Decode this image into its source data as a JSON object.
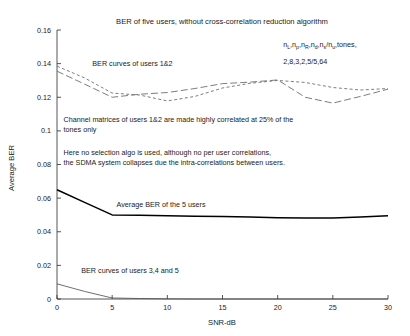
{
  "chart_data": {
    "type": "line",
    "title": "BER of five users, without cross-correlation reduction algorithm",
    "xlabel": "SNR-dB",
    "ylabel": "Average BER",
    "xlim": [
      0,
      30
    ],
    "ylim": [
      0,
      0.16
    ],
    "grid": false,
    "legend_position": "none",
    "xticks": [
      "0",
      "5",
      "10",
      "15",
      "20",
      "25",
      "30"
    ],
    "xtick_values": [
      0,
      5,
      10,
      15,
      20,
      25,
      30
    ],
    "yticks": [
      "0",
      "0.02",
      "0.04",
      "0.06",
      "0.08",
      "0.1",
      "0.12",
      "0.14",
      "0.16"
    ],
    "ytick_values": [
      0,
      0.02,
      0.04,
      0.06,
      0.08,
      0.1,
      0.12,
      0.14,
      0.16
    ],
    "x": [
      0,
      2.5,
      5,
      7.5,
      10,
      12.5,
      15,
      17.5,
      20,
      22.5,
      25,
      27.5,
      30
    ],
    "series": [
      {
        "name": "BER user 1",
        "style": "dashed",
        "values": [
          0.1385,
          0.1315,
          0.1225,
          0.1213,
          0.1178,
          0.1205,
          0.1255,
          0.1283,
          0.13,
          0.1288,
          0.1258,
          0.1243,
          0.1252
        ]
      },
      {
        "name": "BER user 2",
        "style": "dash-long",
        "values": [
          0.1355,
          0.1278,
          0.12,
          0.1218,
          0.1228,
          0.1252,
          0.1281,
          0.129,
          0.1303,
          0.12,
          0.1165,
          0.1205,
          0.1248
        ]
      },
      {
        "name": "Average BER of the 5 users",
        "style": "solid",
        "values": [
          0.065,
          0.0575,
          0.05,
          0.0498,
          0.0495,
          0.0492,
          0.049,
          0.0487,
          0.0484,
          0.0482,
          0.0482,
          0.0487,
          0.0495
        ]
      },
      {
        "name": "BER users 3,4 and 5",
        "style": "thin",
        "values": [
          0.009,
          0.0045,
          0.0006,
          0.0003,
          0.0001,
          0.0,
          0.0,
          0.0,
          0.0,
          0.0,
          0.0,
          0.0,
          0.0
        ]
      }
    ],
    "annotations": [
      {
        "id": "params-symbols",
        "text": "n ,n ,n ,n ,n /n ,tones,",
        "subscripts": "L p R d s u",
        "x": 20.5,
        "y": 0.1497
      },
      {
        "id": "params-values",
        "text": "2,8,3,2,5/5,64",
        "x": 20.5,
        "y": 0.14
      },
      {
        "id": "label-users12",
        "text": "BER curves of users 1&2",
        "x": 3.2,
        "y": 0.1385
      },
      {
        "id": "note-channel-line1",
        "text": "Channel matrices of users 1&2 are made highly correlated at 25% of the",
        "x": 0.6,
        "y": 0.1055
      },
      {
        "id": "note-channel-line2",
        "text": "tones only",
        "x": 0.6,
        "y": 0.0995
      },
      {
        "id": "note-selection-line1",
        "text": "Here no selection algo is used, although no per user correlations,",
        "x": 0.6,
        "y": 0.0855
      },
      {
        "id": "note-selection-line2",
        "text": "the SDMA system collapses due the intra-correlations between users.",
        "x": 0.6,
        "y": 0.0795
      },
      {
        "id": "label-average",
        "text": "Average BER of the 5 users",
        "x": 5.4,
        "y": 0.0545
      },
      {
        "id": "label-users345",
        "text": "BER curves of users 3,4 and 5",
        "x": 2.2,
        "y": 0.0155
      }
    ]
  },
  "colors": {
    "background": "#ffffff",
    "axis": "#2b2b2b",
    "solid_curve": "#000000",
    "dashed_curve": "#6e6e6e",
    "thin_curve": "#4a4a4a",
    "text": "#1a1a1a"
  }
}
